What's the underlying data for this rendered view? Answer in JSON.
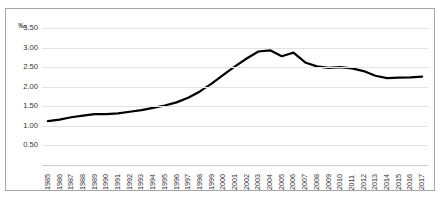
{
  "chart_data": {
    "type": "line",
    "title": "",
    "subtitle": "",
    "xlabel": "",
    "ylabel": "",
    "y_unit": "‰",
    "grid": true,
    "legend": false,
    "ylim": [
      0.0,
      3.5
    ],
    "yticks": [
      "3.50",
      "3.00",
      "2.50",
      "2.00",
      "1.50",
      "1.00",
      "0.50"
    ],
    "ytick_values": [
      3.5,
      3.0,
      2.5,
      2.0,
      1.5,
      1.0,
      0.5
    ],
    "categories": [
      "1985",
      "1986",
      "1987",
      "1988",
      "1989",
      "1990",
      "1991",
      "1992",
      "1993",
      "1994",
      "1995",
      "1996",
      "1997",
      "1998",
      "1999",
      "2000",
      "2001",
      "2002",
      "2003",
      "2004",
      "2005",
      "2006",
      "2007",
      "2008",
      "2009",
      "2010",
      "2011",
      "2012",
      "2013",
      "2014",
      "2015",
      "2016",
      "2017"
    ],
    "values": [
      1.12,
      1.16,
      1.22,
      1.26,
      1.3,
      1.3,
      1.32,
      1.36,
      1.4,
      1.46,
      1.52,
      1.6,
      1.72,
      1.88,
      2.08,
      2.3,
      2.52,
      2.72,
      2.9,
      2.93,
      2.78,
      2.87,
      2.62,
      2.52,
      2.48,
      2.5,
      2.47,
      2.4,
      2.28,
      2.22,
      2.23,
      2.24,
      2.26
    ],
    "series_color": "#000000",
    "grid_color": "#e3e3e3",
    "border_color": "#a6a6a6",
    "line_width": 2.2
  }
}
